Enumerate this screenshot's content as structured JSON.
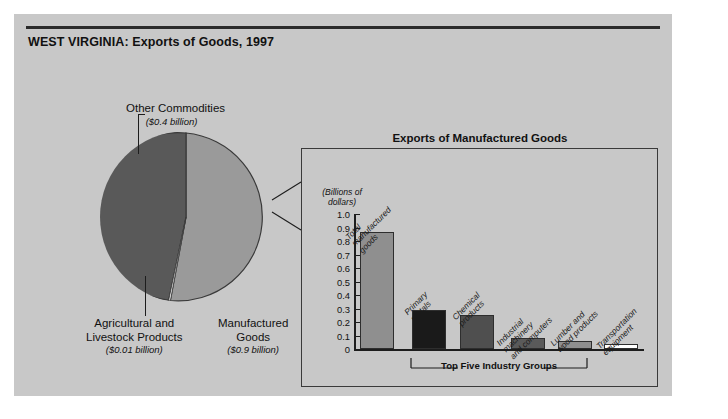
{
  "figure": {
    "title": "WEST VIRGINIA: Exports of Goods, 1997"
  },
  "pie": {
    "slices": [
      {
        "label": "Other Commodities",
        "amount": "($0.4 billion)",
        "value": 0.4,
        "color": "#595959"
      },
      {
        "label": "Manufactured Goods",
        "amount": "($0.9 billion)",
        "value": 0.9,
        "color": "#9a9a9a"
      },
      {
        "label": "Agricultural and\nLivestock Products",
        "amount": "($0.01 billion)",
        "value": 0.01,
        "color": "#ffffff"
      }
    ],
    "labels": {
      "other": "Other Commodities",
      "other_amount": "($0.4 billion)",
      "agricultural_line1": "Agricultural and",
      "agricultural_line2": "Livestock Products",
      "agricultural_amount": "($0.01 billion)",
      "manufactured_line1": "Manufactured",
      "manufactured_line2": "Goods",
      "manufactured_amount": "($0.9 billion)"
    }
  },
  "panel": {
    "title": "Exports of Manufactured Goods",
    "units_line1": "(Billions of",
    "units_line2": "dollars)",
    "bracket_label": "Top Five Industry Groups"
  },
  "chart_data": {
    "type": "bar",
    "title": "Exports of Manufactured Goods",
    "xlabel": "Top Five Industry Groups",
    "ylabel": "(Billions of dollars)",
    "ylim": [
      0,
      1.0
    ],
    "yticks": [
      "1.0",
      "0.9",
      "0.8",
      "0.7",
      "0.6",
      "0.5",
      "0.4",
      "0.3",
      "0.2",
      "0.1",
      "0"
    ],
    "grid": false,
    "legend": "none",
    "categories": [
      "Total manufactured goods",
      "Primary metals",
      "Chemical products",
      "Industrial machinery and computers",
      "Lumber and wood products",
      "Transportation equipment"
    ],
    "values": [
      0.87,
      0.29,
      0.25,
      0.08,
      0.06,
      0.04
    ],
    "bars": [
      {
        "label_lines": [
          "Total",
          "manufactured",
          "goods"
        ],
        "value": 0.87,
        "color": "#8f8f8f"
      },
      {
        "label_lines": [
          "Primary",
          "metals"
        ],
        "value": 0.29,
        "color": "#1a1a1a"
      },
      {
        "label_lines": [
          "Chemical",
          "products"
        ],
        "value": 0.25,
        "color": "#4f4f4f"
      },
      {
        "label_lines": [
          "Industrial",
          "machinery",
          "and computers"
        ],
        "value": 0.08,
        "color": "#5a5a5a"
      },
      {
        "label_lines": [
          "Lumber and",
          "wood products"
        ],
        "value": 0.06,
        "color": "#8f8f8f"
      },
      {
        "label_lines": [
          "Transportation",
          "equipment"
        ],
        "value": 0.04,
        "color": "#ffffff"
      }
    ]
  }
}
